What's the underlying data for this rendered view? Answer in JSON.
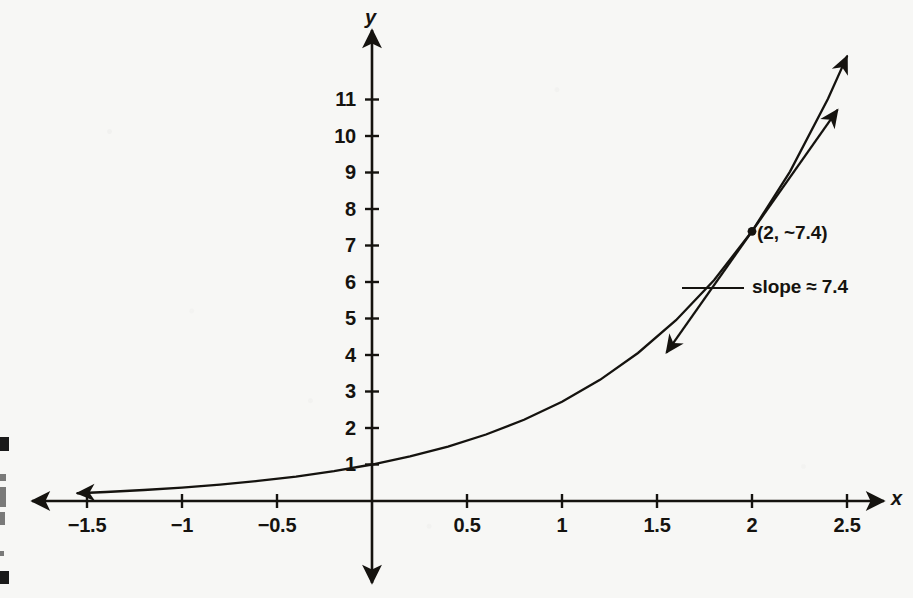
{
  "figure": {
    "background_color": "#f7f7f5",
    "ink_color": "#15130f",
    "width": 913,
    "height": 598
  },
  "axes": {
    "x_axis_name": "x",
    "y_axis_name": "y"
  },
  "annotations": {
    "point_label": "(2, ~7.4)",
    "slope_label": "slope ≈ 7.4"
  },
  "chart_data": {
    "type": "line",
    "title": "",
    "subtitle": "",
    "xlabel": "x",
    "ylabel": "y",
    "grid": false,
    "legend": null,
    "xlim": [
      -1.6,
      2.75
    ],
    "ylim": [
      -0.7,
      12.2
    ],
    "x_ticks": [
      -1.5,
      -1,
      -0.5,
      0.5,
      1,
      1.5,
      2,
      2.5
    ],
    "x_tick_labels": [
      "−1.5",
      "−1",
      "−0.5",
      "0.5",
      "1",
      "1.5",
      "2",
      "2.5"
    ],
    "y_ticks": [
      1,
      2,
      3,
      4,
      5,
      6,
      7,
      8,
      9,
      10,
      11
    ],
    "y_tick_labels": [
      "1",
      "2",
      "3",
      "4",
      "5",
      "6",
      "7",
      "8",
      "9",
      "10",
      "11"
    ],
    "series": [
      {
        "name": "y = e^x",
        "kind": "curve",
        "arrow_start": true,
        "arrow_end": true,
        "x": [
          -1.55,
          -1.4,
          -1.2,
          -1.0,
          -0.8,
          -0.6,
          -0.4,
          -0.2,
          0.0,
          0.2,
          0.4,
          0.6,
          0.8,
          1.0,
          1.2,
          1.4,
          1.6,
          1.8,
          2.0,
          2.2,
          2.4,
          2.5
        ],
        "y": [
          0.212,
          0.247,
          0.301,
          0.368,
          0.449,
          0.549,
          0.67,
          0.819,
          1.0,
          1.221,
          1.492,
          1.822,
          2.226,
          2.718,
          3.32,
          4.055,
          4.953,
          6.05,
          7.389,
          9.025,
          11.023,
          12.182
        ]
      },
      {
        "name": "tangent at x = 2",
        "kind": "line",
        "arrow_start": true,
        "arrow_end": true,
        "slope": 7.389,
        "through_point": [
          2,
          7.389
        ],
        "x": [
          1.55,
          2.45
        ],
        "y": [
          4.064,
          10.715
        ]
      }
    ],
    "points": [
      {
        "label": "(2, ~7.4)",
        "x": 2,
        "y": 7.389
      }
    ],
    "annotations": [
      {
        "text": "(2, ~7.4)",
        "x": 2,
        "y": 7.389
      },
      {
        "text": "slope ≈ 7.4",
        "x": 2.05,
        "y": 5.55
      }
    ]
  }
}
